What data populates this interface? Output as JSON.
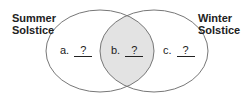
{
  "diagram": {
    "type": "venn",
    "sets": [
      {
        "label_line1": "Summer",
        "label_line2": "Solstice"
      },
      {
        "label_line1": "Winter",
        "label_line2": "Solstice"
      }
    ],
    "regions": [
      {
        "letter": "a.",
        "value": "?"
      },
      {
        "letter": "b.",
        "value": "?"
      },
      {
        "letter": "c.",
        "value": "?"
      }
    ],
    "colors": {
      "overlap": "#e3e3e3",
      "stroke": "#777777"
    }
  }
}
